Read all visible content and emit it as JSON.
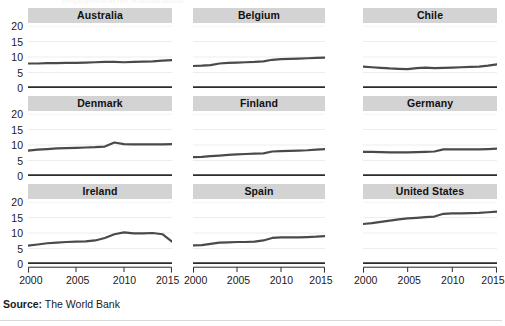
{
  "figure": {
    "clipped_top_text": "Employment in the financial sector",
    "source_prefix": "Source:",
    "source_text": " The World Bank"
  },
  "axes": {
    "y_ticks": [
      "20",
      "15",
      "10",
      "5",
      "0"
    ],
    "x_ticks": [
      "2000",
      "2005",
      "2010",
      "2015"
    ]
  },
  "chart_data": {
    "type": "line",
    "title": "",
    "xlabel": "",
    "ylabel": "",
    "xlim": [
      2000,
      2015
    ],
    "ylim": [
      0,
      20
    ],
    "x": [
      2000,
      2001,
      2002,
      2003,
      2004,
      2005,
      2006,
      2007,
      2008,
      2009,
      2010,
      2011,
      2012,
      2013,
      2014,
      2015
    ],
    "grid": true,
    "legend": "none",
    "layout": "small-multiples 3x3",
    "series": [
      {
        "name": "Australia",
        "values": [
          7.9,
          7.9,
          8.0,
          8.0,
          8.1,
          8.1,
          8.2,
          8.3,
          8.4,
          8.4,
          8.3,
          8.4,
          8.5,
          8.6,
          8.8,
          9.0
        ]
      },
      {
        "name": "Belgium",
        "values": [
          7.1,
          7.2,
          7.4,
          7.9,
          8.1,
          8.2,
          8.3,
          8.4,
          8.6,
          9.1,
          9.3,
          9.4,
          9.5,
          9.6,
          9.7,
          9.8
        ]
      },
      {
        "name": "Chile",
        "values": [
          6.9,
          6.7,
          6.5,
          6.3,
          6.2,
          6.1,
          6.4,
          6.6,
          6.4,
          6.5,
          6.6,
          6.7,
          6.8,
          6.9,
          7.2,
          7.6
        ]
      },
      {
        "name": "Denmark",
        "values": [
          8.2,
          8.5,
          8.7,
          8.9,
          9.0,
          9.1,
          9.2,
          9.3,
          9.5,
          10.8,
          10.3,
          10.2,
          10.2,
          10.2,
          10.2,
          10.3
        ]
      },
      {
        "name": "Finland",
        "values": [
          6.1,
          6.2,
          6.4,
          6.6,
          6.8,
          7.0,
          7.1,
          7.2,
          7.3,
          7.9,
          8.0,
          8.1,
          8.2,
          8.3,
          8.5,
          8.7
        ]
      },
      {
        "name": "Germany",
        "values": [
          7.8,
          7.8,
          7.7,
          7.6,
          7.6,
          7.6,
          7.7,
          7.8,
          7.9,
          8.6,
          8.6,
          8.6,
          8.6,
          8.6,
          8.7,
          8.8
        ]
      },
      {
        "name": "Ireland",
        "values": [
          5.9,
          6.3,
          6.7,
          6.9,
          7.1,
          7.2,
          7.3,
          7.6,
          8.4,
          9.6,
          10.2,
          9.9,
          9.9,
          10.0,
          9.6,
          7.2
        ]
      },
      {
        "name": "Spain",
        "values": [
          6.0,
          6.1,
          6.5,
          6.9,
          7.0,
          7.1,
          7.1,
          7.2,
          7.6,
          8.4,
          8.6,
          8.6,
          8.6,
          8.7,
          8.8,
          9.0
        ]
      },
      {
        "name": "United States",
        "values": [
          12.9,
          13.2,
          13.6,
          14.0,
          14.4,
          14.7,
          14.9,
          15.1,
          15.3,
          16.2,
          16.3,
          16.3,
          16.4,
          16.5,
          16.7,
          16.9
        ]
      }
    ]
  }
}
